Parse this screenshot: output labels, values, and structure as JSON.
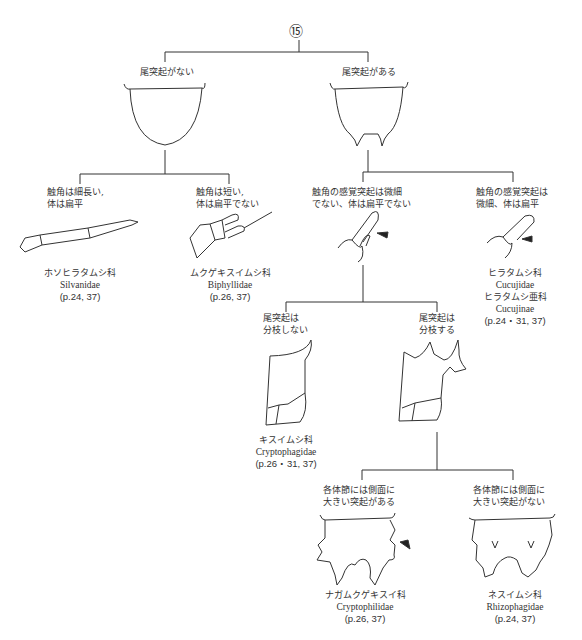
{
  "key": {
    "node_number": "⑮",
    "branches": {
      "no_tail": {
        "label": "尾突起がない"
      },
      "tail": {
        "label": "尾突起がある"
      }
    },
    "no_tail_children": [
      {
        "couplet": [
          "触角は細長い,",
          "体は扁平"
        ],
        "family_ja": "ホソヒラタムシ科",
        "family_en": "Silvanidae",
        "pages": "(p.24, 37)",
        "figure": "antenna-long-slender"
      },
      {
        "couplet": [
          "触角は短い,",
          "体は扁平でない"
        ],
        "family_ja": "ムクゲキスイムシ科",
        "family_en": "Biphyllidae",
        "pages": "(p.26, 37)",
        "figure": "antenna-short"
      }
    ],
    "tail_children": [
      {
        "couplet": [
          "触角の感覚突起は微細",
          "でない、体は扁平でない"
        ],
        "figure": "antenna-sensory-process-large"
      },
      {
        "couplet": [
          "触角の感覚突起は",
          "微細、体は扁平"
        ],
        "family_ja": "ヒラタムシ科",
        "family_en": "Cucujidae",
        "subfamily_ja": "ヒラタムシ亜科",
        "subfamily_en": "Cucujinae",
        "pages": "(p.24・31, 37)",
        "figure": "antenna-sensory-process-minute"
      }
    ],
    "urogomphi_split": [
      {
        "couplet": [
          "尾突起は",
          "分枝しない"
        ],
        "family_ja": "キスイムシ科",
        "family_en": "Cryptophagidae",
        "pages": "(p.26・31, 37)",
        "figure": "urogomphus-unbranched"
      },
      {
        "couplet": [
          "尾突起は",
          "分枝する"
        ],
        "figure": "urogomphus-branched"
      }
    ],
    "segment_split": [
      {
        "couplet": [
          "各体節には側面に",
          "大きい突起がある"
        ],
        "family_ja": "ナガムクゲキスイ科",
        "family_en": "Cryptophilidae",
        "pages": "(p.26, 37)",
        "figure": "abdomen-large-lateral-processes"
      },
      {
        "couplet": [
          "各体節には側面に",
          "大きい突起がない"
        ],
        "family_ja": "ネスイムシ科",
        "family_en": "Rhizophagidae",
        "pages": "(p.24, 37)",
        "figure": "abdomen-no-lateral-processes"
      }
    ]
  },
  "colors": {
    "line": "#333333",
    "text": "#333333",
    "background": "#ffffff"
  }
}
